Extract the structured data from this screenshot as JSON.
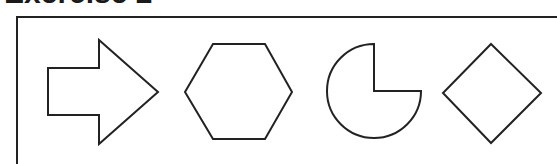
{
  "heading": {
    "text": "Exercise 2"
  },
  "frame": {
    "border_color": "#222222"
  },
  "shapes": [
    {
      "name": "arrow",
      "label": "arrow-shape"
    },
    {
      "name": "hexagon",
      "label": "hexagon-shape"
    },
    {
      "name": "pie",
      "label": "pie-shape",
      "missing_quarter": "top-right"
    },
    {
      "name": "diamond",
      "label": "diamond-shape"
    }
  ]
}
